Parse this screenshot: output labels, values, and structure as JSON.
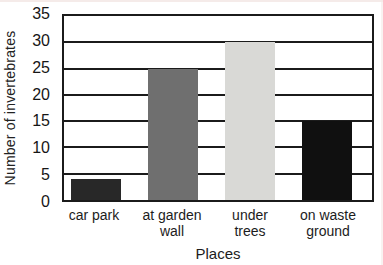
{
  "chart_data": {
    "type": "bar",
    "title": "",
    "xlabel": "Places",
    "ylabel": "Number of invertebrates",
    "categories": [
      "car park",
      "at garden\nwall",
      "under\ntrees",
      "on waste\nground"
    ],
    "values": [
      4,
      25,
      30,
      15
    ],
    "bar_colors": [
      "#282828",
      "#6f6f6f",
      "#d9d9d6",
      "#101010"
    ],
    "ylim": [
      0,
      35
    ],
    "yticks": [
      0,
      5,
      10,
      15,
      20,
      25,
      30,
      35
    ],
    "grid": true,
    "legend": "none",
    "colors": {
      "axis": "#1b1b1b",
      "gridline": "#1b1b1b",
      "text": "#1c1c1c",
      "plot_background": "#ffffff"
    }
  }
}
